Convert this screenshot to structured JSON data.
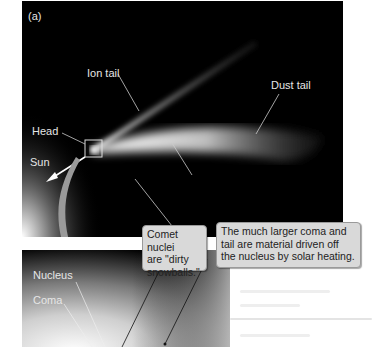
{
  "figure": {
    "panel_label": "(a)",
    "top_panel": {
      "labels": {
        "ion_tail": "Ion tail",
        "dust_tail": "Dust tail",
        "head": "Head",
        "sun": "Sun"
      }
    },
    "bottom_panel": {
      "labels": {
        "nucleus": "Nucleus",
        "coma": "Coma"
      }
    },
    "callouts": [
      {
        "lines": [
          "Comet nuclei",
          "are \"dirty",
          "snowballs.\""
        ]
      },
      {
        "lines": [
          "The much larger coma and",
          "tail are material driven off",
          "the nucleus by solar heating."
        ]
      }
    ],
    "colors": {
      "background": "#000000",
      "callout_fill": "#d9d9d9",
      "label_text": "#e6e6e6",
      "arrow": "#9a9a9a"
    }
  }
}
